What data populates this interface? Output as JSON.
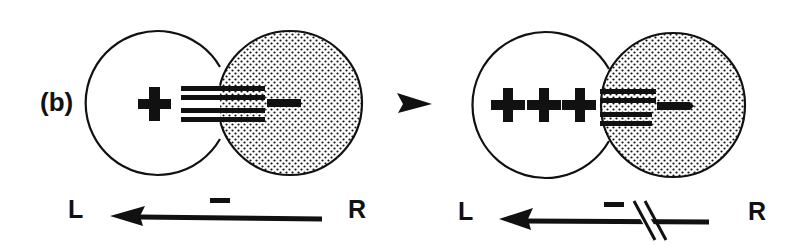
{
  "panel_label": "(b)",
  "colors": {
    "ink": "#111111",
    "background": "#ffffff"
  },
  "left_diagram": {
    "left_sphere_charge": "+",
    "left_sphere_charge_count": 1,
    "right_sphere_charge": "−",
    "bond_lines": 4,
    "axis": {
      "left_label": "L",
      "right_label": "R",
      "field_sign": "−",
      "arrow_direction": "R to L",
      "broken": false
    }
  },
  "transition_arrow": "➤",
  "right_diagram": {
    "left_sphere_charge": "+++",
    "left_sphere_charge_count": 3,
    "right_sphere_charge": "−",
    "bond_lines": 4,
    "axis": {
      "left_label": "L",
      "right_label": "R",
      "field_sign": "−",
      "arrow_direction": "R to L",
      "broken": true
    }
  }
}
